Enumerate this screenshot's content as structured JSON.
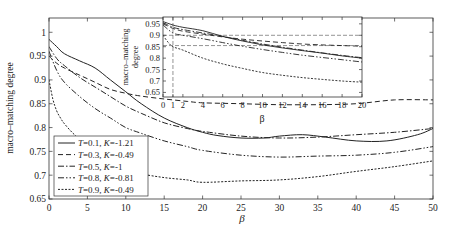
{
  "chart_data": {
    "type": "line",
    "title": "",
    "xlabel": "β",
    "ylabel": "macro–matching degree",
    "xlim": [
      0,
      50
    ],
    "ylim": [
      0.65,
      1.03
    ],
    "xticks": [
      0,
      5,
      10,
      15,
      20,
      25,
      30,
      35,
      40,
      45,
      50
    ],
    "yticks": [
      0.65,
      0.7,
      0.75,
      0.8,
      0.85,
      0.9,
      0.95,
      1
    ],
    "ytick_labels": [
      "0.65",
      "0.7",
      "0.75",
      "0.8",
      "0.85",
      "0.9",
      "0.95",
      "1"
    ],
    "grid": false,
    "legend_position": "lower left",
    "series": [
      {
        "name": "T=0.1, K=-1.21",
        "T": "0.1",
        "K": "-1.21",
        "style": "solid",
        "x": [
          0,
          1,
          2,
          4,
          6,
          8,
          10,
          12,
          15,
          18,
          20,
          22,
          25,
          28,
          30,
          33,
          36,
          40,
          44,
          48,
          50
        ],
        "y": [
          0.985,
          0.97,
          0.955,
          0.94,
          0.925,
          0.9,
          0.875,
          0.85,
          0.82,
          0.8,
          0.79,
          0.783,
          0.778,
          0.778,
          0.782,
          0.785,
          0.78,
          0.772,
          0.772,
          0.785,
          0.798
        ]
      },
      {
        "name": "T=0.3, K=-0.49",
        "T": "0.3",
        "K": "-0.49",
        "style": "dashed",
        "x": [
          0,
          1,
          2,
          4,
          6,
          8,
          10,
          12,
          15,
          18,
          20,
          25,
          30,
          35,
          40,
          45,
          50
        ],
        "y": [
          0.95,
          0.935,
          0.925,
          0.91,
          0.895,
          0.88,
          0.872,
          0.866,
          0.86,
          0.855,
          0.852,
          0.85,
          0.848,
          0.848,
          0.85,
          0.858,
          0.858
        ]
      },
      {
        "name": "T=0.5, K=-1",
        "T": "0.5",
        "K": "-1",
        "style": "dashdot",
        "x": [
          0,
          1,
          2,
          4,
          6,
          8,
          10,
          12,
          15,
          18,
          20,
          25,
          30,
          35,
          40,
          45,
          50
        ],
        "y": [
          0.97,
          0.945,
          0.93,
          0.905,
          0.885,
          0.865,
          0.845,
          0.83,
          0.81,
          0.798,
          0.792,
          0.782,
          0.778,
          0.78,
          0.785,
          0.79,
          0.798
        ]
      },
      {
        "name": "T=0.8, K=-0.81",
        "T": "0.8",
        "K": "-0.81",
        "style": "dashdotdot",
        "x": [
          0,
          1,
          2,
          4,
          6,
          8,
          10,
          12,
          15,
          18,
          20,
          25,
          30,
          35,
          40,
          45,
          50
        ],
        "y": [
          0.96,
          0.92,
          0.895,
          0.865,
          0.84,
          0.82,
          0.8,
          0.788,
          0.772,
          0.76,
          0.752,
          0.742,
          0.738,
          0.74,
          0.742,
          0.748,
          0.76
        ]
      },
      {
        "name": "T=0.9, K=-0.49",
        "T": "0.9",
        "K": "-0.49",
        "style": "dotted",
        "x": [
          0,
          0.5,
          1,
          1.5,
          2,
          3,
          4,
          5,
          6,
          8,
          10,
          12,
          15,
          18,
          20,
          25,
          30,
          35,
          40,
          45,
          50
        ],
        "y": [
          0.9,
          0.86,
          0.835,
          0.82,
          0.808,
          0.79,
          0.775,
          0.762,
          0.75,
          0.732,
          0.715,
          0.703,
          0.695,
          0.69,
          0.685,
          0.688,
          0.69,
          0.697,
          0.708,
          0.718,
          0.73
        ]
      }
    ],
    "inset": {
      "xlabel": "β",
      "ylabel": "macro–matching degree",
      "xlim": [
        0,
        20
      ],
      "ylim": [
        0.63,
        0.98
      ],
      "xticks": [
        0,
        1,
        2,
        4,
        6,
        8,
        10,
        12,
        14,
        16,
        18,
        20
      ],
      "yticks": [
        0.65,
        0.7,
        0.75,
        0.8,
        0.85,
        0.9,
        0.95
      ],
      "ytick_labels": [
        "0.65",
        "0.7",
        "0.75",
        "0.8",
        "0.85",
        "0.9",
        "0.95"
      ],
      "reference_lines": [
        {
          "orientation": "vertical",
          "x": 1,
          "style": "dashed"
        },
        {
          "orientation": "horizontal",
          "y": 0.9,
          "style": "dashed"
        },
        {
          "orientation": "horizontal",
          "y": 0.855,
          "style": "dashed"
        }
      ],
      "series": [
        {
          "name": "T=0.1, K=-1.21",
          "style": "solid",
          "x": [
            0,
            1,
            2,
            4,
            6,
            8,
            10,
            12,
            14,
            16,
            18,
            20
          ],
          "y": [
            0.96,
            0.945,
            0.935,
            0.92,
            0.895,
            0.875,
            0.858,
            0.845,
            0.833,
            0.822,
            0.81,
            0.8
          ]
        },
        {
          "name": "T=0.3, K=-0.49",
          "style": "dashed",
          "x": [
            0,
            1,
            2,
            4,
            6,
            8,
            10,
            12,
            14,
            16,
            18,
            20
          ],
          "y": [
            0.95,
            0.93,
            0.918,
            0.905,
            0.893,
            0.883,
            0.875,
            0.868,
            0.862,
            0.858,
            0.855,
            0.852
          ]
        },
        {
          "name": "T=0.5, K=-1",
          "style": "dashdot",
          "x": [
            0,
            1,
            2,
            4,
            6,
            8,
            10,
            12,
            14,
            16,
            18,
            20
          ],
          "y": [
            0.955,
            0.935,
            0.925,
            0.91,
            0.895,
            0.878,
            0.862,
            0.848,
            0.835,
            0.823,
            0.812,
            0.802
          ]
        },
        {
          "name": "T=0.8, K=-0.81",
          "style": "dashdotdot",
          "x": [
            0,
            1,
            2,
            4,
            6,
            8,
            10,
            12,
            14,
            16,
            18,
            20
          ],
          "y": [
            0.945,
            0.91,
            0.9,
            0.885,
            0.868,
            0.852,
            0.838,
            0.825,
            0.813,
            0.803,
            0.793,
            0.783
          ]
        },
        {
          "name": "T=0.9, K=-0.49",
          "style": "dotted",
          "x": [
            0,
            0.5,
            1,
            2,
            4,
            6,
            8,
            10,
            12,
            14,
            16,
            18,
            20
          ],
          "y": [
            0.9,
            0.87,
            0.85,
            0.835,
            0.8,
            0.775,
            0.755,
            0.737,
            0.725,
            0.715,
            0.707,
            0.7,
            0.695
          ]
        }
      ]
    }
  },
  "legend": {
    "entries": [
      {
        "T": "0.1",
        "K": "-1.21"
      },
      {
        "T": "0.3",
        "K": "-0.49"
      },
      {
        "T": "0.5",
        "K": "-1"
      },
      {
        "T": "0.8",
        "K": "-0.81"
      },
      {
        "T": "0.9",
        "K": "-0.49"
      }
    ]
  },
  "colors": {
    "line": "#222222",
    "axis": "#333333",
    "background": "#ffffff"
  }
}
